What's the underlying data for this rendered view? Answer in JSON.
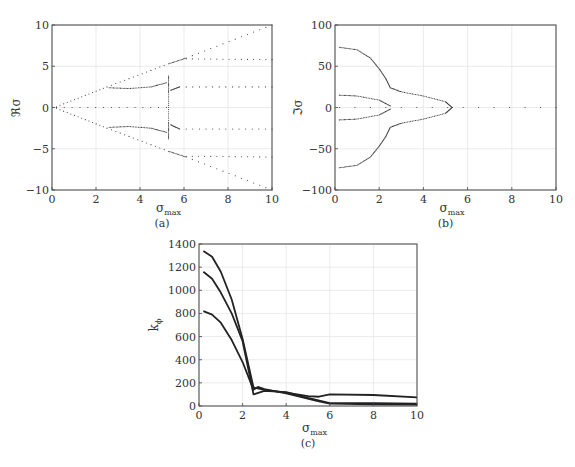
{
  "header_fragment": "",
  "chart_data": [
    {
      "id": "a",
      "type": "scatter",
      "caption": "(a)",
      "title": "",
      "xlabel": "σ_max",
      "ylabel": "ℜσ",
      "xlim": [
        0,
        10
      ],
      "ylim": [
        -10,
        10
      ],
      "xticks": [
        0,
        2,
        4,
        6,
        8,
        10
      ],
      "yticks": [
        -10,
        -5,
        0,
        5,
        10
      ],
      "grid": true,
      "marker": "dotted",
      "series": [
        {
          "name": "upper envelope",
          "x": [
            0.2,
            2.5,
            5.3,
            6.1,
            10
          ],
          "y": [
            0.1,
            2.5,
            5.3,
            6.0,
            10
          ]
        },
        {
          "name": "lower envelope",
          "x": [
            0.2,
            2.5,
            5.3,
            6.1,
            10
          ],
          "y": [
            -0.1,
            -2.5,
            -5.3,
            -6.0,
            -10
          ]
        },
        {
          "name": "zero branch",
          "x": [
            0.2,
            5.2
          ],
          "y": [
            0,
            0
          ]
        },
        {
          "name": "branch +2.5 (left)",
          "x": [
            2.6,
            3.5,
            4.5,
            5.2
          ],
          "y": [
            2.4,
            2.3,
            2.5,
            3.0
          ]
        },
        {
          "name": "branch -2.5 (left)",
          "x": [
            2.6,
            3.5,
            4.5,
            5.2
          ],
          "y": [
            -2.4,
            -2.3,
            -2.5,
            -3.0
          ]
        },
        {
          "name": "jump points",
          "x": [
            5.3,
            5.3,
            5.3,
            5.3
          ],
          "y": [
            3.8,
            1.8,
            -1.8,
            -3.8
          ]
        },
        {
          "name": "branch +2.5 (right)",
          "x": [
            5.4,
            5.8,
            10
          ],
          "y": [
            2.1,
            2.5,
            2.5
          ]
        },
        {
          "name": "branch -2.5 (right)",
          "x": [
            5.4,
            5.8,
            10
          ],
          "y": [
            -2.1,
            -2.6,
            -2.6
          ]
        },
        {
          "name": "branch +5.8",
          "x": [
            6.1,
            10
          ],
          "y": [
            5.9,
            5.8
          ]
        },
        {
          "name": "branch -6",
          "x": [
            6.1,
            10
          ],
          "y": [
            -5.9,
            -6.0
          ]
        }
      ]
    },
    {
      "id": "b",
      "type": "scatter",
      "caption": "(b)",
      "title": "",
      "xlabel": "σ_max",
      "ylabel": "ℑσ",
      "xlim": [
        0,
        10
      ],
      "ylim": [
        -100,
        100
      ],
      "xticks": [
        0,
        2,
        4,
        6,
        8,
        10
      ],
      "yticks": [
        -100,
        -50,
        0,
        50,
        100
      ],
      "grid": true,
      "marker": "dotted",
      "series": [
        {
          "name": "upper outer",
          "x": [
            0.2,
            1.0,
            1.6,
            2.0,
            2.3,
            2.5,
            3.0,
            4.0,
            5.0,
            5.3
          ],
          "y": [
            73,
            70,
            60,
            47,
            35,
            24,
            19,
            14,
            7,
            0
          ]
        },
        {
          "name": "lower outer",
          "x": [
            0.2,
            1.0,
            1.6,
            2.0,
            2.3,
            2.5,
            3.0,
            4.0,
            5.0,
            5.3
          ],
          "y": [
            -73,
            -70,
            -60,
            -47,
            -35,
            -24,
            -19,
            -14,
            -7,
            0
          ]
        },
        {
          "name": "upper inner",
          "x": [
            0.2,
            1.0,
            2.0,
            2.5
          ],
          "y": [
            15,
            14,
            9,
            2
          ]
        },
        {
          "name": "lower inner",
          "x": [
            0.2,
            1.0,
            2.0,
            2.5
          ],
          "y": [
            -15,
            -14,
            -9,
            -2
          ]
        },
        {
          "name": "zero",
          "x": [
            0.2,
            10
          ],
          "y": [
            0,
            0
          ]
        }
      ]
    },
    {
      "id": "c",
      "type": "line",
      "caption": "(c)",
      "title": "",
      "xlabel": "σ_max",
      "ylabel": "k_ϕ",
      "xlim": [
        0,
        10
      ],
      "ylim": [
        0,
        1400
      ],
      "xticks": [
        0,
        2,
        4,
        6,
        8,
        10
      ],
      "yticks": [
        0,
        200,
        400,
        600,
        800,
        1000,
        1200,
        1400
      ],
      "grid": true,
      "series": [
        {
          "name": "curve 1",
          "x": [
            0.2,
            0.6,
            1.0,
            1.5,
            2.0,
            2.5,
            3.0,
            4.0,
            5.0,
            5.5,
            6.0,
            8.0,
            10.0
          ],
          "y": [
            1340,
            1290,
            1160,
            920,
            580,
            160,
            140,
            115,
            85,
            80,
            100,
            95,
            75
          ]
        },
        {
          "name": "curve 2",
          "x": [
            0.2,
            0.6,
            1.0,
            1.5,
            2.0,
            2.5,
            3.0,
            4.0,
            5.0,
            6.0,
            8.0,
            10.0
          ],
          "y": [
            1160,
            1100,
            980,
            800,
            560,
            100,
            130,
            120,
            70,
            25,
            25,
            20
          ]
        },
        {
          "name": "curve 3",
          "x": [
            0.2,
            0.6,
            1.0,
            1.5,
            2.0,
            2.5,
            2.7,
            3.0,
            4.0,
            5.5,
            6.0,
            8.0,
            10.0
          ],
          "y": [
            820,
            790,
            720,
            570,
            380,
            140,
            165,
            145,
            110,
            40,
            20,
            15,
            12
          ]
        }
      ]
    }
  ]
}
